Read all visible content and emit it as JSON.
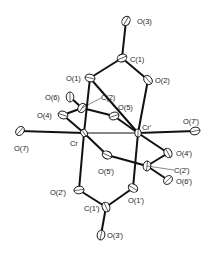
{
  "diagram": {
    "type": "ORTEP molecular structure",
    "colors": {
      "bond": "#111111",
      "atom_outline": "#111111",
      "label": "#222222",
      "background": "#ffffff"
    },
    "atoms": [
      {
        "id": "O3",
        "label": "O(3)",
        "x": 126,
        "y": 21
      },
      {
        "id": "C1",
        "label": "C(1)",
        "x": 122,
        "y": 58
      },
      {
        "id": "O1",
        "label": "O(1)",
        "x": 90,
        "y": 78
      },
      {
        "id": "O2",
        "label": "O(2)",
        "x": 148,
        "y": 80
      },
      {
        "id": "O6",
        "label": "O(6)",
        "x": 70,
        "y": 97
      },
      {
        "id": "C2",
        "label": "C(2)",
        "x": 82,
        "y": 108
      },
      {
        "id": "O5",
        "label": "O(5)",
        "x": 114,
        "y": 116
      },
      {
        "id": "O4",
        "label": "O(4)",
        "x": 63,
        "y": 115
      },
      {
        "id": "Cr",
        "label": "Cr",
        "x": 84,
        "y": 133
      },
      {
        "id": "Crp",
        "label": "Cr'",
        "x": 138,
        "y": 133
      },
      {
        "id": "O7",
        "label": "O(7)",
        "x": 20,
        "y": 131
      },
      {
        "id": "O7p",
        "label": "O(7')",
        "x": 195,
        "y": 131
      },
      {
        "id": "O5p",
        "label": "O(5')",
        "x": 107,
        "y": 155
      },
      {
        "id": "O4p",
        "label": "O(4')",
        "x": 168,
        "y": 153
      },
      {
        "id": "C2p",
        "label": "C(2')",
        "x": 147,
        "y": 166
      },
      {
        "id": "O6p",
        "label": "O(6')",
        "x": 168,
        "y": 180
      },
      {
        "id": "O2p",
        "label": "O(2')",
        "x": 79,
        "y": 190
      },
      {
        "id": "O1p",
        "label": "O(1')",
        "x": 133,
        "y": 188
      },
      {
        "id": "C1p",
        "label": "C(1')",
        "x": 106,
        "y": 207
      },
      {
        "id": "O3p",
        "label": "O(3')",
        "x": 101,
        "y": 235
      }
    ],
    "labels": {
      "O3": "O(3)",
      "C1": "C(1)",
      "O1": "O(1)",
      "O2": "O(2)",
      "O6": "O(6)",
      "C2": "C(2)",
      "O5": "O(5)",
      "O4": "O(4)",
      "Cr": "Cr",
      "Crp": "Cr'",
      "O7": "O(7)",
      "O7p": "O(7')",
      "O5p": "O(5')",
      "O4p": "O(4')",
      "C2p": "C(2')",
      "O6p": "O(6')",
      "O2p": "O(2')",
      "O1p": "O(1')",
      "C1p": "C(1')",
      "O3p": "O(3')"
    },
    "bonds": [
      [
        "O3",
        "C1"
      ],
      [
        "C1",
        "O1"
      ],
      [
        "C1",
        "O2"
      ],
      [
        "O1",
        "Crp"
      ],
      [
        "O2",
        "Crp"
      ],
      [
        "O1",
        "Cr"
      ],
      [
        "O6",
        "C2"
      ],
      [
        "C2",
        "O4"
      ],
      [
        "C2",
        "O5"
      ],
      [
        "O5",
        "Crp"
      ],
      [
        "O4",
        "Cr"
      ],
      [
        "Cr",
        "Crp"
      ],
      [
        "O7",
        "Cr"
      ],
      [
        "Crp",
        "O7p"
      ],
      [
        "Cr",
        "O5p"
      ],
      [
        "O5p",
        "C2p"
      ],
      [
        "C2p",
        "O4p"
      ],
      [
        "C2p",
        "O6p"
      ],
      [
        "O4p",
        "Crp"
      ],
      [
        "Cr",
        "O2p"
      ],
      [
        "Crp",
        "O1p"
      ],
      [
        "O2p",
        "C1p"
      ],
      [
        "O1p",
        "C1p"
      ],
      [
        "C1p",
        "O3p"
      ]
    ]
  }
}
